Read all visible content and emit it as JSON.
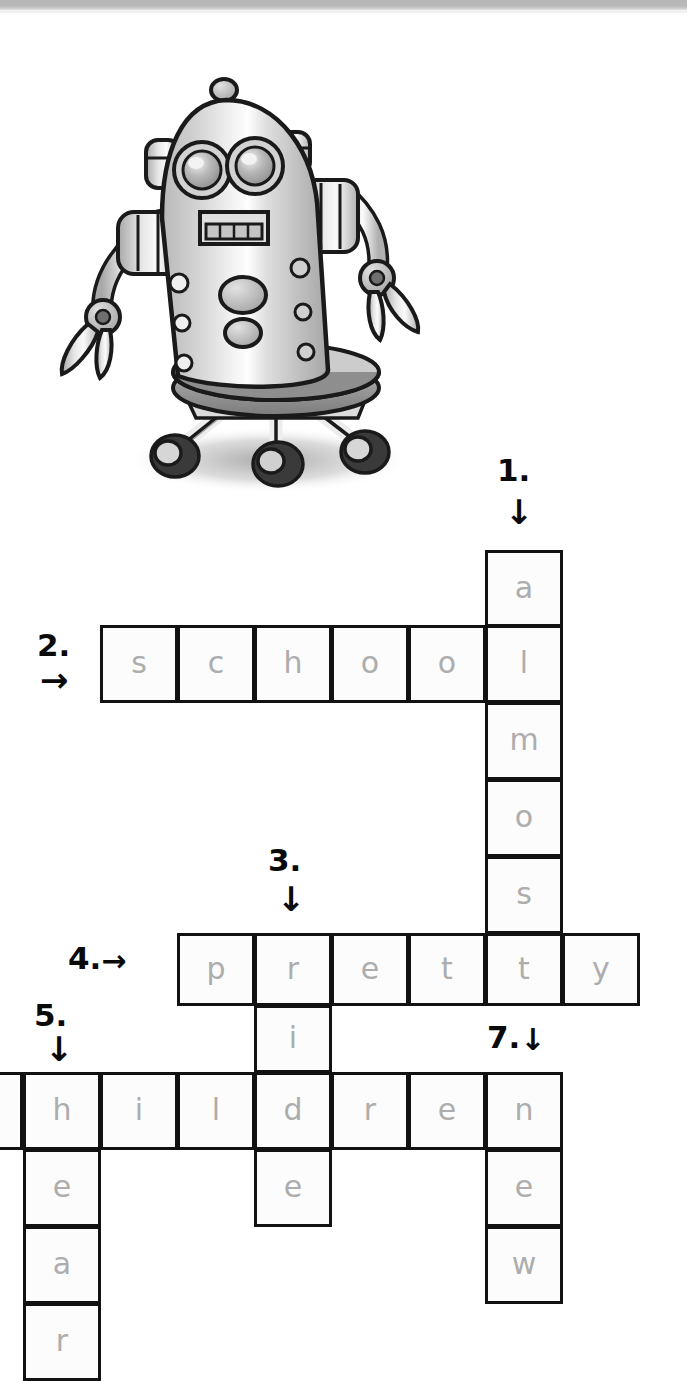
{
  "page": {
    "type": "crossword-worksheet",
    "illustration": "robot-illustration",
    "cell_size": 77,
    "grid_origin_x": 100,
    "grid_origin_y": 550,
    "ink_color": "#0a0a0a",
    "letter_color": "#adadad",
    "cell_border_color": "#121212",
    "cell_fill": "#fcfcfc",
    "scanbar_color": "#b5b5b5"
  },
  "clues": [
    {
      "id": "clue-1",
      "number": "1.",
      "direction": "down",
      "arrow": "↓",
      "label_left": 497,
      "label_top": 455,
      "arrow_left": 505,
      "arrow_top": 495
    },
    {
      "id": "clue-2",
      "number": "2.",
      "direction": "across",
      "arrow": "→",
      "label_left": 37,
      "label_top": 630,
      "arrow_left": 40,
      "arrow_top": 663
    },
    {
      "id": "clue-3",
      "number": "3.",
      "direction": "down",
      "arrow": "↓",
      "label_left": 268,
      "label_top": 845,
      "arrow_left": 277,
      "arrow_top": 882
    },
    {
      "id": "clue-4",
      "number": "4.",
      "direction": "across",
      "arrow": "→",
      "label_left": 68,
      "label_top": 943,
      "arrow_left": 0,
      "arrow_top": 0,
      "inline": true
    },
    {
      "id": "clue-5",
      "number": "5.",
      "direction": "down",
      "arrow": "↓",
      "label_left": 34,
      "label_top": 1000,
      "arrow_left": 45,
      "arrow_top": 1032
    },
    {
      "id": "clue-7",
      "number": "7.",
      "direction": "down",
      "arrow": "↓",
      "label_left": 487,
      "label_top": 1022,
      "arrow_left": 0,
      "arrow_top": 0,
      "inline": true
    }
  ],
  "answers": [
    {
      "id": "answer-1-down",
      "number": "1.",
      "direction": "down",
      "word": "almost"
    },
    {
      "id": "answer-2-across",
      "number": "2.",
      "direction": "across",
      "word": "school"
    },
    {
      "id": "answer-3-down",
      "number": "3.",
      "direction": "down",
      "word": "ride"
    },
    {
      "id": "answer-4-across",
      "number": "4.",
      "direction": "across",
      "word": "pretty"
    },
    {
      "id": "answer-5-down",
      "number": "5.",
      "direction": "down",
      "word": "hear"
    },
    {
      "id": "answer-6-across",
      "number": "6.",
      "direction": "across",
      "word": "children"
    },
    {
      "id": "answer-7-down",
      "number": "7.",
      "direction": "down",
      "word": "new"
    }
  ],
  "cells": [
    {
      "letter": "a",
      "x": 485,
      "y": 550,
      "w": 78,
      "h": 77
    },
    {
      "letter": "s",
      "x": 100,
      "y": 625,
      "w": 78,
      "h": 78
    },
    {
      "letter": "c",
      "x": 177,
      "y": 625,
      "w": 78,
      "h": 78
    },
    {
      "letter": "h",
      "x": 254,
      "y": 625,
      "w": 78,
      "h": 78
    },
    {
      "letter": "o",
      "x": 331,
      "y": 625,
      "w": 78,
      "h": 78
    },
    {
      "letter": "o",
      "x": 408,
      "y": 625,
      "w": 78,
      "h": 78
    },
    {
      "letter": "l",
      "x": 485,
      "y": 625,
      "w": 78,
      "h": 78
    },
    {
      "letter": "m",
      "x": 485,
      "y": 702,
      "w": 78,
      "h": 78
    },
    {
      "letter": "o",
      "x": 485,
      "y": 779,
      "w": 78,
      "h": 78
    },
    {
      "letter": "s",
      "x": 485,
      "y": 856,
      "w": 78,
      "h": 78
    },
    {
      "letter": "p",
      "x": 177,
      "y": 933,
      "w": 78,
      "h": 73
    },
    {
      "letter": "r",
      "x": 254,
      "y": 933,
      "w": 78,
      "h": 73
    },
    {
      "letter": "e",
      "x": 331,
      "y": 933,
      "w": 78,
      "h": 73
    },
    {
      "letter": "t",
      "x": 408,
      "y": 933,
      "w": 78,
      "h": 73
    },
    {
      "letter": "t",
      "x": 485,
      "y": 933,
      "w": 78,
      "h": 73
    },
    {
      "letter": "y",
      "x": 562,
      "y": 933,
      "w": 78,
      "h": 73
    },
    {
      "letter": "i",
      "x": 254,
      "y": 1005,
      "w": 78,
      "h": 68
    },
    {
      "letter": "",
      "x": -55,
      "y": 1072,
      "w": 78,
      "h": 78
    },
    {
      "letter": "h",
      "x": 23,
      "y": 1072,
      "w": 78,
      "h": 78
    },
    {
      "letter": "i",
      "x": 100,
      "y": 1072,
      "w": 78,
      "h": 78
    },
    {
      "letter": "l",
      "x": 177,
      "y": 1072,
      "w": 78,
      "h": 78
    },
    {
      "letter": "d",
      "x": 254,
      "y": 1072,
      "w": 78,
      "h": 78
    },
    {
      "letter": "r",
      "x": 331,
      "y": 1072,
      "w": 78,
      "h": 78
    },
    {
      "letter": "e",
      "x": 408,
      "y": 1072,
      "w": 78,
      "h": 78
    },
    {
      "letter": "n",
      "x": 485,
      "y": 1072,
      "w": 78,
      "h": 78
    },
    {
      "letter": "e",
      "x": 23,
      "y": 1149,
      "w": 78,
      "h": 78
    },
    {
      "letter": "e",
      "x": 254,
      "y": 1149,
      "w": 78,
      "h": 78
    },
    {
      "letter": "e",
      "x": 485,
      "y": 1149,
      "w": 78,
      "h": 78
    },
    {
      "letter": "a",
      "x": 23,
      "y": 1226,
      "w": 78,
      "h": 78
    },
    {
      "letter": "w",
      "x": 485,
      "y": 1226,
      "w": 78,
      "h": 78
    },
    {
      "letter": "r",
      "x": 23,
      "y": 1303,
      "w": 78,
      "h": 78
    }
  ]
}
